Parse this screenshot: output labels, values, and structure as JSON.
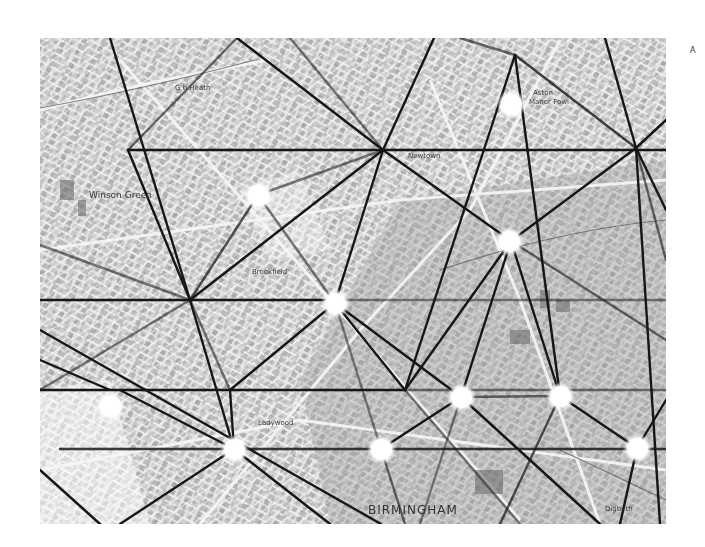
{
  "map": {
    "style": "greyscale street map overlaid with triangulation lines and node circles",
    "city_label": "BIRMINGHAM",
    "place_labels": [
      {
        "name": "G b Heath",
        "x": 175,
        "y": 88,
        "size": "sm"
      },
      {
        "name": "Winson Green",
        "x": 89,
        "y": 196,
        "size": "md"
      },
      {
        "name": "Newtown",
        "x": 408,
        "y": 156,
        "size": "sm"
      },
      {
        "name": "Aston",
        "x": 531,
        "y": 93,
        "size": "sm"
      },
      {
        "name": "Manor Fowl",
        "x": 529,
        "y": 102,
        "size": "sm"
      },
      {
        "name": "Brookfield",
        "x": 252,
        "y": 272,
        "size": "sm"
      },
      {
        "name": "Ladywood",
        "x": 258,
        "y": 424,
        "size": "sm"
      },
      {
        "name": "Digbeth",
        "x": 605,
        "y": 509,
        "size": "sm"
      }
    ],
    "corner_mark": "A",
    "colors": {
      "background": "#ffffff",
      "map_base": "#d9d9d9",
      "lines": "#1a1a1a",
      "nodes": "#ffffff"
    },
    "nodes": [
      {
        "x": 511,
        "y": 104
      },
      {
        "x": 258,
        "y": 195
      },
      {
        "x": 509,
        "y": 241
      },
      {
        "x": 335,
        "y": 303
      },
      {
        "x": 110,
        "y": 406
      },
      {
        "x": 461,
        "y": 397
      },
      {
        "x": 560,
        "y": 396
      },
      {
        "x": 234,
        "y": 449
      },
      {
        "x": 381,
        "y": 449
      },
      {
        "x": 637,
        "y": 448
      }
    ]
  }
}
